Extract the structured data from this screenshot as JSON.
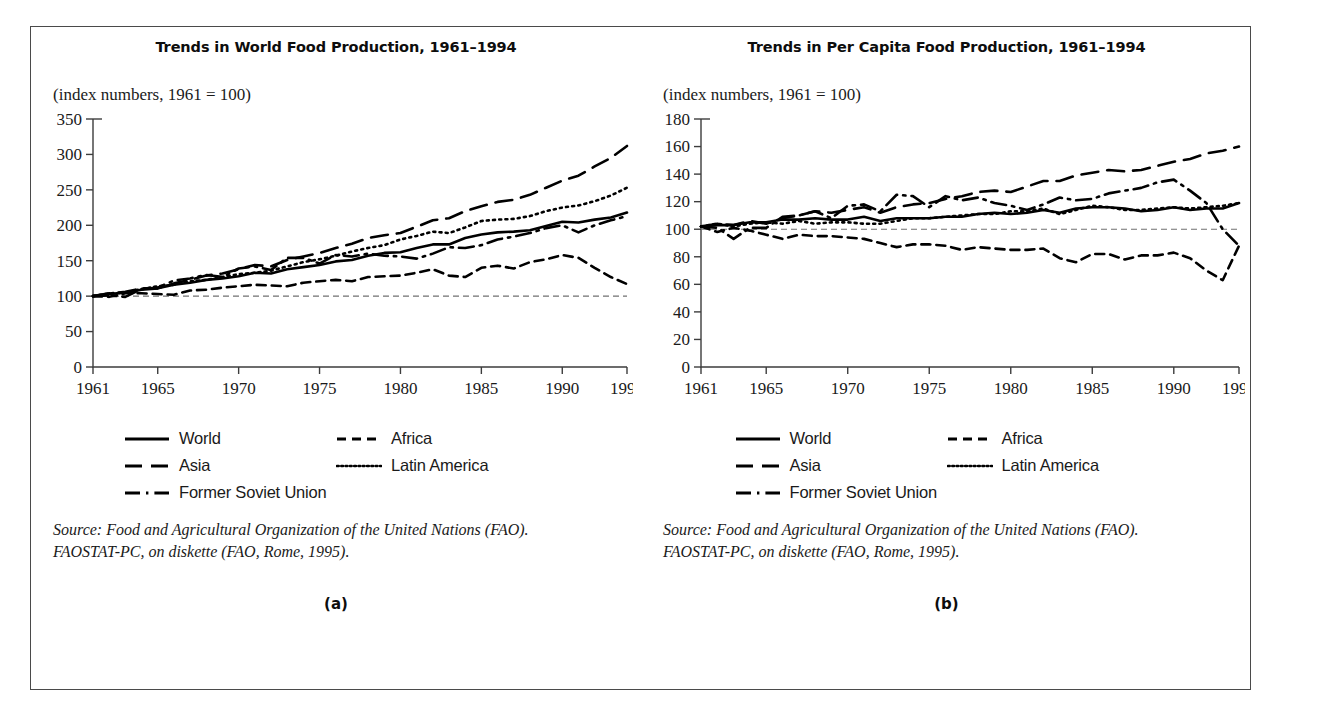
{
  "figure": {
    "panels": [
      {
        "id": "a",
        "panel_label": "(a)",
        "title": "Trends in World Food Production, 1961–1994",
        "subtitle": "(index numbers, 1961 = 100)",
        "source_line1": "Source: Food and Agricultural Organization of the United Nations (FAO).",
        "source_line2": "FAOSTAT-PC, on diskette (FAO, Rome, 1995)."
      },
      {
        "id": "b",
        "panel_label": "(b)",
        "title": "Trends in Per Capita Food Production, 1961–1994",
        "subtitle": "(index numbers, 1961 = 100)",
        "source_line1": "Source: Food and Agricultural Organization of the United Nations (FAO).",
        "source_line2": "FAOSTAT-PC, on diskette (FAO, Rome, 1995)."
      }
    ],
    "legend": {
      "entries": [
        {
          "label": "World",
          "style": "solid",
          "dash": "none"
        },
        {
          "label": "Africa",
          "style": "short-dash",
          "dash": "8 5"
        },
        {
          "label": "Asia",
          "style": "long-dash",
          "dash": "15 8"
        },
        {
          "label": "Latin America",
          "style": "dotted",
          "dash": "1.6 3.4"
        },
        {
          "label": "Former Soviet Union",
          "style": "dash-dot",
          "dash": "13 5 2 5"
        }
      ]
    }
  },
  "chart_data": [
    {
      "type": "line",
      "title": "Trends in World Food Production, 1961–1994",
      "subtitle": "(index numbers, 1961 = 100)",
      "xlabel": "",
      "ylabel": "index numbers, 1961 = 100",
      "xlim": [
        1961,
        1994
      ],
      "ylim": [
        0,
        350
      ],
      "yticks": [
        0,
        50,
        100,
        150,
        200,
        250,
        300,
        350
      ],
      "xticks": [
        1961,
        1965,
        1970,
        1975,
        1980,
        1985,
        1990,
        1994
      ],
      "grid": false,
      "legend_position": "below",
      "reference_line": 100,
      "x": [
        1961,
        1962,
        1963,
        1964,
        1965,
        1966,
        1967,
        1968,
        1969,
        1970,
        1971,
        1972,
        1973,
        1974,
        1975,
        1976,
        1977,
        1978,
        1979,
        1980,
        1981,
        1982,
        1983,
        1984,
        1985,
        1986,
        1987,
        1988,
        1989,
        1990,
        1991,
        1992,
        1993,
        1994
      ],
      "series": [
        {
          "name": "World",
          "style": "solid",
          "values": [
            100,
            103,
            105,
            109,
            111,
            116,
            119,
            123,
            125,
            128,
            133,
            132,
            138,
            141,
            144,
            149,
            151,
            157,
            161,
            162,
            168,
            173,
            173,
            182,
            187,
            190,
            191,
            193,
            199,
            205,
            204,
            208,
            211,
            218
          ]
        },
        {
          "name": "Africa",
          "style": "short-dash",
          "values": [
            100,
            99,
            104,
            104,
            103,
            102,
            108,
            109,
            112,
            114,
            116,
            115,
            114,
            119,
            121,
            123,
            121,
            127,
            128,
            129,
            133,
            138,
            129,
            127,
            140,
            143,
            139,
            148,
            152,
            158,
            154,
            140,
            127,
            117
          ]
        },
        {
          "name": "Asia",
          "style": "long-dash",
          "values": [
            100,
            104,
            106,
            111,
            111,
            118,
            123,
            129,
            132,
            138,
            144,
            142,
            151,
            156,
            161,
            168,
            174,
            182,
            186,
            189,
            198,
            207,
            210,
            220,
            227,
            233,
            236,
            243,
            253,
            263,
            270,
            283,
            295,
            312
          ]
        },
        {
          "name": "Latin America",
          "style": "dotted",
          "values": [
            100,
            104,
            105,
            110,
            114,
            116,
            121,
            123,
            127,
            131,
            133,
            136,
            142,
            148,
            152,
            157,
            163,
            168,
            172,
            180,
            185,
            191,
            189,
            197,
            206,
            208,
            209,
            213,
            220,
            225,
            228,
            234,
            242,
            253
          ]
        },
        {
          "name": "Former Soviet Union",
          "style": "dash-dot",
          "values": [
            100,
            101,
            99,
            110,
            112,
            122,
            125,
            130,
            127,
            139,
            142,
            137,
            154,
            154,
            146,
            158,
            156,
            160,
            157,
            156,
            153,
            160,
            169,
            168,
            172,
            180,
            184,
            189,
            196,
            200,
            190,
            200,
            207,
            213
          ]
        }
      ]
    },
    {
      "type": "line",
      "title": "Trends in Per Capita Food Production, 1961–1994",
      "subtitle": "(index numbers, 1961 = 100)",
      "xlabel": "",
      "ylabel": "index numbers, 1961 = 100",
      "xlim": [
        1961,
        1994
      ],
      "ylim": [
        0,
        180
      ],
      "yticks": [
        0,
        20,
        40,
        60,
        80,
        100,
        120,
        140,
        160,
        180
      ],
      "xticks": [
        1961,
        1965,
        1970,
        1975,
        1980,
        1985,
        1990,
        1994
      ],
      "grid": false,
      "legend_position": "below",
      "reference_line": 100,
      "x": [
        1961,
        1962,
        1963,
        1964,
        1965,
        1966,
        1967,
        1968,
        1969,
        1970,
        1971,
        1972,
        1973,
        1974,
        1975,
        1976,
        1977,
        1978,
        1979,
        1980,
        1981,
        1982,
        1983,
        1984,
        1985,
        1986,
        1987,
        1988,
        1989,
        1990,
        1991,
        1992,
        1993,
        1994
      ],
      "series": [
        {
          "name": "World",
          "style": "solid",
          "values": [
            102,
            103,
            103,
            105,
            105,
            107,
            107,
            108,
            107,
            107,
            109,
            106,
            108,
            108,
            108,
            109,
            109,
            111,
            112,
            111,
            112,
            114,
            112,
            115,
            116,
            116,
            115,
            113,
            114,
            116,
            114,
            115,
            115,
            119
          ]
        },
        {
          "name": "Africa",
          "style": "short-dash",
          "values": [
            102,
            98,
            101,
            99,
            96,
            93,
            96,
            95,
            95,
            94,
            93,
            90,
            87,
            89,
            89,
            88,
            85,
            87,
            86,
            85,
            85,
            86,
            79,
            76,
            82,
            82,
            78,
            81,
            81,
            83,
            79,
            70,
            63,
            88
          ]
        },
        {
          "name": "Asia",
          "style": "long-dash",
          "values": [
            102,
            104,
            103,
            106,
            104,
            108,
            110,
            113,
            112,
            114,
            116,
            112,
            116,
            118,
            119,
            122,
            124,
            127,
            128,
            127,
            131,
            135,
            135,
            139,
            141,
            143,
            142,
            143,
            146,
            149,
            151,
            155,
            157,
            160
          ]
        },
        {
          "name": "Latin America",
          "style": "dotted",
          "values": [
            102,
            104,
            102,
            104,
            105,
            104,
            106,
            104,
            105,
            105,
            104,
            104,
            106,
            108,
            108,
            109,
            110,
            111,
            111,
            113,
            113,
            115,
            111,
            114,
            117,
            116,
            114,
            114,
            115,
            116,
            115,
            116,
            117,
            119
          ]
        },
        {
          "name": "Former Soviet Union",
          "style": "dash-dot",
          "values": [
            102,
            101,
            93,
            101,
            101,
            109,
            110,
            113,
            108,
            117,
            118,
            113,
            125,
            124,
            116,
            124,
            121,
            123,
            119,
            117,
            114,
            118,
            123,
            121,
            122,
            126,
            128,
            130,
            134,
            136,
            128,
            119,
            100,
            88
          ]
        }
      ]
    }
  ]
}
